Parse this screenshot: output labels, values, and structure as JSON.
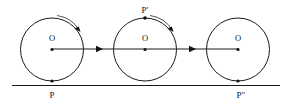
{
  "figure": {
    "background_color": "#ffffff",
    "stroke_color": "#1a1a1a",
    "arc_color": "#555555",
    "ground_line": {
      "name": "ground-line",
      "x1": 12,
      "y1": 85.5,
      "x2": 280,
      "y2": 85.5
    },
    "center_line": {
      "name": "center-axis-line",
      "x1": 52,
      "y1": 49,
      "x2": 238,
      "y2": 49
    },
    "circles": [
      {
        "id": "circle-1",
        "cx": 52,
        "cy": 49.5,
        "r": 31.5,
        "center_label": "O",
        "center_label_x": 50,
        "center_label_y": 41,
        "point_label": "P",
        "point_label_x": 52,
        "point_label_y": 98,
        "point_marker_x": 52,
        "point_marker_y": 81,
        "has_rotation_arc": true
      },
      {
        "id": "circle-2",
        "cx": 145,
        "cy": 49.5,
        "r": 31.5,
        "center_label": "O",
        "center_label_x": 143,
        "center_label_y": 41,
        "point_label": "P′",
        "point_label_x": 145,
        "point_label_y": 12,
        "point_marker_x": 145,
        "point_marker_y": 18,
        "has_rotation_arc": true
      },
      {
        "id": "circle-3",
        "cx": 238,
        "cy": 49.5,
        "r": 31.5,
        "center_label": "O",
        "center_label_x": 236,
        "center_label_y": 41,
        "point_label": "P″",
        "point_label_x": 241,
        "point_label_y": 98,
        "point_marker_x": 238,
        "point_marker_y": 81,
        "has_rotation_arc": false
      }
    ],
    "translation_arrows": [
      {
        "id": "translation-arrow-1",
        "tip_x": 103,
        "tip_y": 49,
        "direction": "right"
      },
      {
        "id": "translation-arrow-2",
        "tip_x": 196,
        "tip_y": 49,
        "direction": "right"
      }
    ],
    "rotation_arcs": [
      {
        "id": "rotation-arc-1",
        "path": "M 58 16 A 30 30 0 0 1 80 31",
        "arrow_tip_x": 80,
        "arrow_tip_y": 31
      },
      {
        "id": "rotation-arc-2",
        "path": "M 151 16 A 30 30 0 0 1 173 31",
        "arrow_tip_x": 173,
        "arrow_tip_y": 31
      }
    ],
    "labels": {
      "center_o": "O",
      "point_p": "P",
      "point_p_prime": "P′",
      "point_p_double_prime": "P″"
    }
  }
}
